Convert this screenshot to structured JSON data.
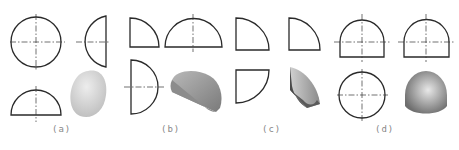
{
  "figure": {
    "panels": [
      {
        "id": "a",
        "label": "(a)",
        "solid": "hemisphere",
        "views": [
          "circle-front",
          "semicircle-side",
          "semicircle-top",
          "shaded-3d-hemisphere"
        ]
      },
      {
        "id": "b",
        "label": "(b)",
        "solid": "half-cylinder-quarter",
        "views": [
          "quarter-arc-front",
          "semicircle-side",
          "semicircle-top",
          "shaded-3d-half-disc"
        ]
      },
      {
        "id": "c",
        "label": "(c)",
        "solid": "quarter-sphere",
        "views": [
          "quarter-arc-front",
          "quarter-arc-side",
          "quarter-arc-top",
          "shaded-3d-quarter"
        ]
      },
      {
        "id": "d",
        "label": "(d)",
        "solid": "dome-cylinder",
        "views": [
          "dome-front",
          "dome-side",
          "circle-top",
          "shaded-3d-dome"
        ]
      }
    ],
    "colors": {
      "line": "#2a2a2a",
      "label": "#888888",
      "shade_light": "#e4e4e4",
      "shade_mid": "#a8a8a8",
      "shade_dark": "#4a4a4a"
    }
  }
}
